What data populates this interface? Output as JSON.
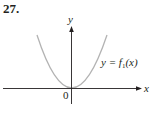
{
  "problem_number": "27.",
  "axes": {
    "x_label": "x",
    "y_label": "y",
    "origin_label": "0"
  },
  "curve": {
    "label_prefix": "y = f",
    "label_subscript": "1",
    "label_suffix": "(x)",
    "shape": "parabola opening upward, vertex at origin",
    "color": "#b3b3b3"
  },
  "colors": {
    "axis": "#231f20",
    "curve": "#b3b3b3",
    "background": "#ffffff"
  }
}
